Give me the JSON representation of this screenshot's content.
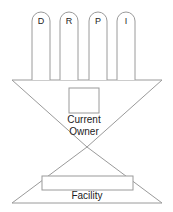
{
  "diagram": {
    "type": "bowtie-diagram",
    "colors": {
      "stroke": "#9a9a9a",
      "fill": "#ffffff",
      "text": "#1c1c1c",
      "background": "#ffffff"
    },
    "top_bars": [
      {
        "label": "D",
        "x": 32,
        "y": 12,
        "width": 18,
        "height": 68
      },
      {
        "label": "R",
        "x": 60,
        "y": 12,
        "width": 18,
        "height": 68
      },
      {
        "label": "P",
        "x": 89,
        "y": 12,
        "width": 18,
        "height": 68
      },
      {
        "label": "I",
        "x": 117,
        "y": 12,
        "width": 18,
        "height": 68
      }
    ],
    "upper_triangle": {
      "name": "upper-inverted-triangle",
      "left_x": 12,
      "right_x": 162,
      "top_y": 80,
      "apex_x": 87,
      "apex_y": 147
    },
    "lower_triangle": {
      "name": "lower-triangle",
      "left_x": 12,
      "right_x": 162,
      "bottom_y": 203,
      "apex_x": 87,
      "apex_y": 147
    },
    "center_box": {
      "name": "current-owner-box",
      "x": 69,
      "y": 88,
      "width": 30,
      "height": 25
    },
    "center_label_line1": "Current",
    "center_label_line2": "Owner",
    "facility_box": {
      "name": "facility-box",
      "x": 42,
      "y": 176,
      "width": 91,
      "height": 14
    },
    "facility_label": "Facility"
  }
}
